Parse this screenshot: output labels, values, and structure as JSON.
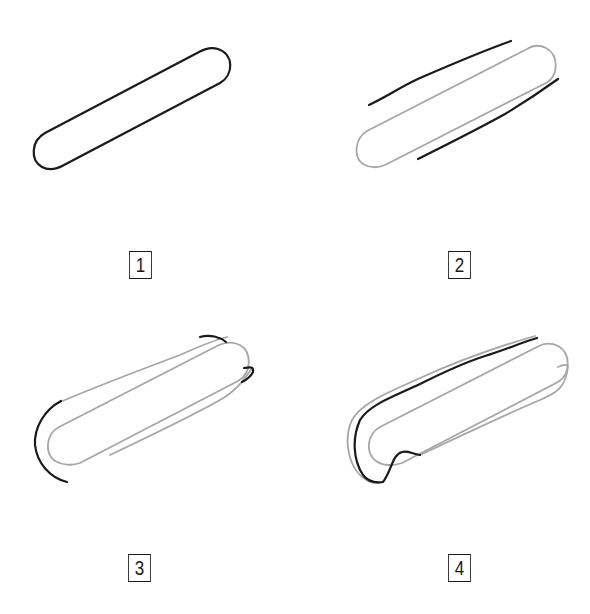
{
  "colors": {
    "ink": "#1a1a1a",
    "guide": "#a6a6a6",
    "background": "#ffffff"
  },
  "steps": [
    {
      "number": "1",
      "description": "Draw a long slanted rounded capsule outline"
    },
    {
      "number": "2",
      "description": "Capsule becomes guide (grey); add two parallel lines above and below"
    },
    {
      "number": "3",
      "description": "Connect lines into outer shell; add curved ends"
    },
    {
      "number": "4",
      "description": "Refine outer contour with wavy line and notch at bottom"
    }
  ]
}
